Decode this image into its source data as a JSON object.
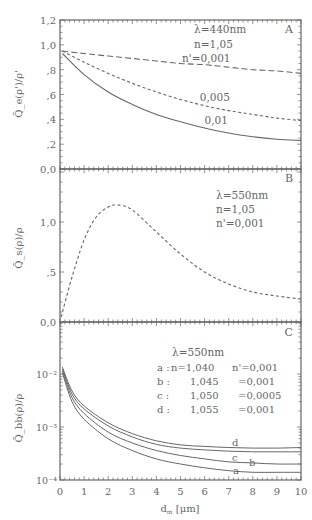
{
  "figure": {
    "xlabel": "d_m [μm]",
    "xticks": [
      "0",
      "1",
      "2",
      "3",
      "4",
      "5",
      "6",
      "7",
      "8",
      "9",
      "10"
    ]
  },
  "chart_data": [
    {
      "panel": "A",
      "type": "line",
      "ylabel": "Q̄_e(ρ')/ρ'",
      "xlim": [
        0,
        10
      ],
      "ylim": [
        0.0,
        1.2
      ],
      "yticks": [
        "0,0",
        ",2",
        ",4",
        ",6",
        ",8",
        "1,0",
        "1,2"
      ],
      "annotation": [
        "λ=440nm",
        "n=1,05",
        "n'=0,001"
      ],
      "series": [
        {
          "name": "0,001",
          "style": "long-dash",
          "x": [
            0.1,
            1,
            2,
            3,
            4,
            5,
            6,
            7,
            8,
            9,
            10
          ],
          "y": [
            0.95,
            0.93,
            0.91,
            0.89,
            0.87,
            0.85,
            0.84,
            0.82,
            0.8,
            0.79,
            0.77
          ]
        },
        {
          "name": "0,005",
          "style": "short-dash",
          "x": [
            0.1,
            1,
            2,
            3,
            4,
            5,
            6,
            7,
            8,
            9,
            10
          ],
          "y": [
            0.95,
            0.86,
            0.77,
            0.69,
            0.62,
            0.56,
            0.51,
            0.47,
            0.44,
            0.41,
            0.39
          ]
        },
        {
          "name": "0,01",
          "style": "solid",
          "x": [
            0.1,
            1,
            2,
            3,
            4,
            5,
            6,
            7,
            8,
            9,
            10
          ],
          "y": [
            0.93,
            0.76,
            0.62,
            0.52,
            0.44,
            0.38,
            0.33,
            0.29,
            0.26,
            0.24,
            0.23
          ]
        }
      ],
      "labels": [
        {
          "text": "0,005",
          "x": 5.8,
          "y": 0.55
        },
        {
          "text": "0,01",
          "x": 6.0,
          "y": 0.36
        }
      ]
    },
    {
      "panel": "B",
      "type": "line",
      "ylabel": "Q̄_s(ρ)/ρ",
      "xlim": [
        0,
        10
      ],
      "ylim": [
        0.0,
        1.5
      ],
      "yticks": [
        "0,0",
        ",5",
        "1,0"
      ],
      "annotation": [
        "λ=550nm",
        "n=1,05",
        "n'=0,001"
      ],
      "series": [
        {
          "name": "n'=0,001",
          "style": "short-dash",
          "x": [
            0.05,
            0.5,
            1.0,
            1.5,
            2.0,
            2.4,
            3.0,
            4.0,
            5.0,
            6.0,
            7.0,
            8.0,
            9.0,
            10.0
          ],
          "y": [
            0.05,
            0.45,
            0.82,
            1.05,
            1.15,
            1.17,
            1.12,
            0.9,
            0.68,
            0.5,
            0.38,
            0.3,
            0.26,
            0.23
          ]
        }
      ]
    },
    {
      "panel": "C",
      "type": "line",
      "ylabel": "Q̄_bb(ρ)/ρ",
      "xlabel": "d_m [μm]",
      "xlim": [
        0,
        10
      ],
      "yscale": "log",
      "ylim": [
        0.0001,
        0.03
      ],
      "yticks": [
        "10⁻⁴",
        "10⁻³",
        "10⁻²"
      ],
      "annotation": {
        "title": "λ=550nm",
        "rows": [
          {
            "key": "a :",
            "n": "n=1,040",
            "np": "n'=0,001"
          },
          {
            "key": "b :",
            "n": "1,045",
            "np": "=0,001"
          },
          {
            "key": "c :",
            "n": "1,050",
            "np": "=0,0005"
          },
          {
            "key": "d :",
            "n": "1,055",
            "np": "=0,001"
          }
        ]
      },
      "series": [
        {
          "name": "a",
          "x": [
            0.1,
            0.5,
            1,
            2,
            3,
            4,
            5,
            6,
            7,
            8,
            9,
            10
          ],
          "y": [
            0.0105,
            0.003,
            0.0014,
            0.0006,
            0.00036,
            0.00025,
            0.0002,
            0.00017,
            0.00015,
            0.00014,
            0.00014,
            0.00014
          ]
        },
        {
          "name": "b",
          "x": [
            0.1,
            0.5,
            1,
            2,
            3,
            4,
            5,
            6,
            7,
            8,
            9,
            10
          ],
          "y": [
            0.0115,
            0.0036,
            0.0018,
            0.0008,
            0.0005,
            0.00036,
            0.00029,
            0.00025,
            0.00022,
            0.00021,
            0.0002,
            0.0002
          ]
        },
        {
          "name": "c",
          "x": [
            0.1,
            0.5,
            1,
            2,
            3,
            4,
            5,
            6,
            7,
            8,
            9,
            10
          ],
          "y": [
            0.0125,
            0.0042,
            0.0022,
            0.00105,
            0.00065,
            0.00047,
            0.0004,
            0.00037,
            0.00035,
            0.00034,
            0.00034,
            0.00034
          ]
        },
        {
          "name": "d",
          "x": [
            0.1,
            0.5,
            1,
            2,
            3,
            4,
            5,
            6,
            7,
            8,
            9,
            10
          ],
          "y": [
            0.0135,
            0.0048,
            0.0025,
            0.0012,
            0.00075,
            0.00055,
            0.00046,
            0.00043,
            0.00041,
            0.0004,
            0.0004,
            0.00041
          ]
        }
      ]
    }
  ]
}
